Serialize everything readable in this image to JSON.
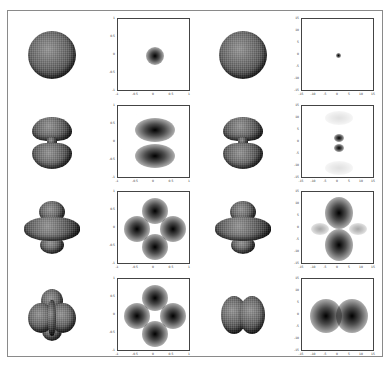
{
  "figure": {
    "colors": {
      "frame": "#8a8a8a",
      "axes": "#444444",
      "density": "#111111",
      "background": "#ffffff"
    },
    "rows": [
      {
        "left_surface": "sphere",
        "left_plot": {
          "ticks_x": [
            "-1",
            "-0.5",
            "0",
            "0.5",
            "1"
          ],
          "ticks_y": [
            "1",
            "0.5",
            "0",
            "-0.5",
            "-1"
          ],
          "pattern": "single central spot"
        },
        "right_surface": "sphere",
        "right_plot": {
          "ticks_x": [
            "-15",
            "-10",
            "-5",
            "0",
            "5",
            "10",
            "15"
          ],
          "ticks_y": [
            "15",
            "10",
            "5",
            "0",
            "-5",
            "-10",
            "-15"
          ],
          "pattern": "tiny central dot"
        }
      },
      {
        "left_surface": "dumbbell (two lobes with neck)",
        "left_plot": {
          "ticks_x": [
            "-1",
            "-0.5",
            "0",
            "0.5",
            "1"
          ],
          "ticks_y": [
            "1",
            "0.5",
            "0",
            "-0.5",
            "-1"
          ],
          "pattern": "two horizontal lobes above and below with faint ring"
        },
        "right_surface": "dumbbell (two lobes with neck)",
        "right_plot": {
          "ticks_x": [
            "-15",
            "-10",
            "-5",
            "0",
            "5",
            "10",
            "15"
          ],
          "ticks_y": [
            "15",
            "10",
            "5",
            "0",
            "-5",
            "-10",
            "-15"
          ],
          "pattern": "two small stacked dots with faint outer lobes"
        }
      },
      {
        "left_surface": "lobes with torus",
        "left_plot": {
          "ticks_x": [
            "-1",
            "-0.5",
            "0",
            "0.5",
            "1"
          ],
          "ticks_y": [
            "1",
            "0.5",
            "0",
            "-0.5",
            "-1"
          ],
          "pattern": "four spots in diamond"
        },
        "right_surface": "lobes with torus",
        "right_plot": {
          "ticks_x": [
            "-15",
            "-10",
            "-5",
            "0",
            "5",
            "10",
            "15"
          ],
          "ticks_y": [
            "15",
            "10",
            "5",
            "0",
            "-5",
            "-10",
            "-15"
          ],
          "pattern": "vertical lobes strong, horizontal lobes faint"
        }
      },
      {
        "left_surface": "clover multi-lobe",
        "left_plot": {
          "ticks_x": [
            "-1",
            "-0.5",
            "0",
            "0.5",
            "1"
          ],
          "ticks_y": [
            "1",
            "0.5",
            "0",
            "-0.5",
            "-1"
          ],
          "pattern": "four spots in diamond"
        },
        "right_surface": "two side-by-side lobes",
        "right_plot": {
          "ticks_x": [
            "-15",
            "-10",
            "-5",
            "0",
            "5",
            "10",
            "15"
          ],
          "ticks_y": [
            "15",
            "10",
            "5",
            "0",
            "-5",
            "-10",
            "-15"
          ],
          "pattern": "two horizontal spots left and right"
        }
      }
    ]
  }
}
